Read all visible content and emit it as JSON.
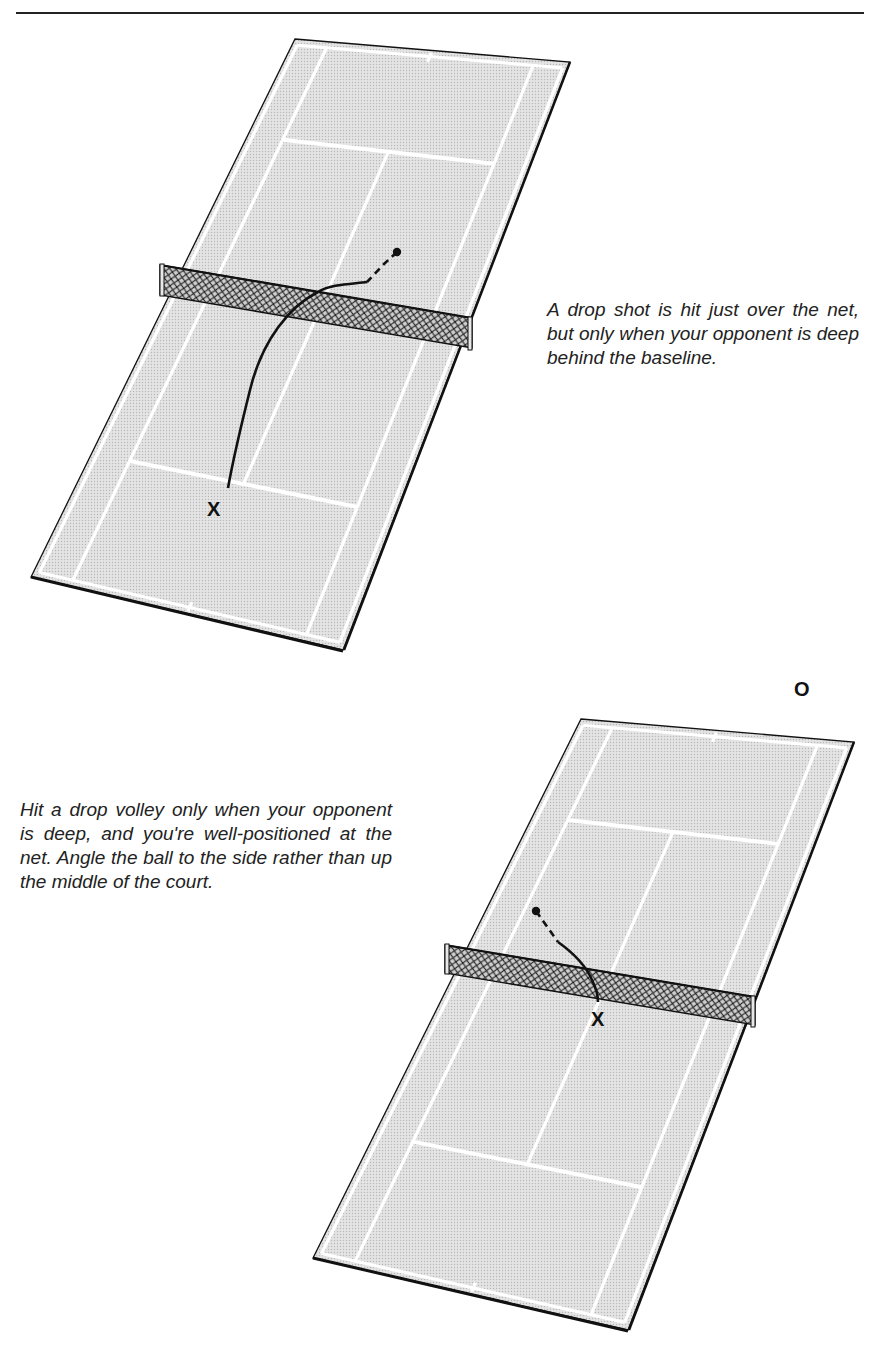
{
  "page": {
    "header_text": "TACTICS · DROP SHOTS"
  },
  "captions": {
    "drop_shot": "A drop shot is hit just over the net, but only when your opponent is deep behind the baseline.",
    "drop_volley": "Hit a drop volley only when your opponent is deep, and you're well-positioned at the net. Angle the ball to the side rather than up the middle of the court."
  },
  "labels": {
    "player": "X",
    "opponent": "O"
  },
  "colors": {
    "court_fill": "#d9d9d9",
    "court_lines": "#ffffff",
    "outline": "#111111",
    "net_mesh": "#222222",
    "net_bg": "#bdbdbd",
    "trajectory": "#111111"
  },
  "courts": [
    {
      "name": "drop-shot-court",
      "corners": {
        "tl": [
          295,
          39
        ],
        "tr": [
          570,
          62
        ],
        "bl": [
          31,
          577
        ],
        "br": [
          343,
          650
        ]
      },
      "v_far_service": 0.18,
      "v_net": 0.48,
      "v_near_service": 0.77,
      "net": {
        "tl": [
          160,
          265
        ],
        "tr": [
          472,
          318
        ],
        "height": 30
      },
      "trajectory": {
        "ball": [
          397,
          252
        ],
        "dash": [
          [
            397,
            252
          ],
          [
            384,
            264
          ],
          [
            367,
            282
          ]
        ],
        "solid": "M 367 282 C 352 284, 330 284, 318 292 C 290 306, 262 340, 250 390 C 240 430, 233 460, 228 488"
      },
      "player_label_pos": [
        207,
        498
      ]
    },
    {
      "name": "drop-volley-court",
      "corners": {
        "tl": [
          581,
          719
        ],
        "tr": [
          854,
          742
        ],
        "bl": [
          313,
          1258
        ],
        "br": [
          628,
          1330
        ]
      },
      "v_far_service": 0.18,
      "v_net": 0.48,
      "v_near_service": 0.77,
      "net": {
        "tl": [
          445,
          945
        ],
        "tr": [
          755,
          997
        ],
        "height": 28
      },
      "trajectory": {
        "ball": [
          536,
          911
        ],
        "dash": [
          [
            536,
            911
          ],
          [
            548,
            928
          ],
          [
            558,
            942
          ]
        ],
        "solid": "M 558 942 C 572 952, 586 966, 592 980 C 597 990, 598 996, 598 1002"
      },
      "player_label_pos": [
        591,
        1008
      ],
      "opponent_label_pos": [
        794,
        678
      ]
    }
  ]
}
